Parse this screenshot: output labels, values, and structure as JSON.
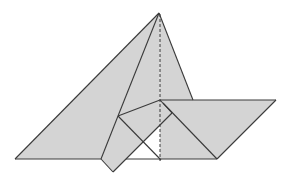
{
  "diagram": {
    "width": 291,
    "height": 186,
    "background": "#ffffff",
    "fill_color": "#d4d4d4",
    "stroke_color": "#3a3a3a",
    "points": {
      "apex": [
        159,
        13
      ],
      "left_base": [
        15,
        159
      ],
      "inner_fold_top": [
        118,
        116
      ],
      "inner_base_left": [
        101,
        159
      ],
      "flap_bottom": [
        113,
        172
      ],
      "rect_top_right": [
        160,
        100
      ],
      "rect_right": [
        172,
        113
      ],
      "white_left": [
        126,
        159
      ],
      "white_top": [
        160,
        126
      ],
      "dash_base": [
        160,
        161
      ],
      "tri_right_at_para": [
        193,
        100
      ],
      "para_top_right": [
        276,
        100
      ],
      "para_bottom_right": [
        217,
        159
      ],
      "thin_diag_end": [
        161,
        160
      ]
    },
    "regions": [
      {
        "name": "big-triangle-left",
        "points": [
          [
            159,
            13
          ],
          [
            15,
            159
          ],
          [
            126,
            159
          ],
          [
            160,
            126
          ]
        ]
      },
      {
        "name": "big-triangle-right",
        "points": [
          [
            159,
            13
          ],
          [
            193,
            100
          ],
          [
            160,
            100
          ]
        ]
      },
      {
        "name": "parallelogram",
        "points": [
          [
            160,
            100
          ],
          [
            276,
            100
          ],
          [
            217,
            159
          ],
          [
            160,
            159
          ]
        ]
      },
      {
        "name": "folded-rectangle",
        "points": [
          [
            118,
            116
          ],
          [
            160,
            100
          ],
          [
            172,
            113
          ],
          [
            113,
            172
          ],
          [
            101,
            159
          ]
        ]
      }
    ],
    "white_region": {
      "name": "white-gap-triangle",
      "points": [
        [
          126,
          159
        ],
        [
          160,
          126
        ],
        [
          160,
          159
        ]
      ]
    },
    "solid_lines": [
      {
        "name": "left-edge",
        "from": [
          159,
          13
        ],
        "to": [
          15,
          159
        ]
      },
      {
        "name": "base-left",
        "from": [
          15,
          159
        ],
        "to": [
          101,
          159
        ]
      },
      {
        "name": "inner-fold-line",
        "from": [
          159,
          13
        ],
        "to": [
          118,
          116
        ]
      },
      {
        "name": "inner-fold-lower",
        "from": [
          118,
          116
        ],
        "to": [
          101,
          159
        ]
      },
      {
        "name": "flap-left",
        "from": [
          101,
          159
        ],
        "to": [
          113,
          172
        ]
      },
      {
        "name": "flap-bottom-edge",
        "from": [
          113,
          172
        ],
        "to": [
          172,
          113
        ]
      },
      {
        "name": "rect-top-edge",
        "from": [
          118,
          116
        ],
        "to": [
          160,
          100
        ]
      },
      {
        "name": "rect-right-edge",
        "from": [
          160,
          100
        ],
        "to": [
          172,
          113
        ]
      },
      {
        "name": "thin-diagonal",
        "from": [
          118,
          116
        ],
        "to": [
          161,
          160
        ]
      },
      {
        "name": "base-middle",
        "from": [
          126,
          159
        ],
        "to": [
          160,
          159
        ]
      },
      {
        "name": "triangle-right-edge",
        "from": [
          159,
          13
        ],
        "to": [
          193,
          100
        ]
      },
      {
        "name": "para-top",
        "from": [
          160,
          100
        ],
        "to": [
          276,
          100
        ]
      },
      {
        "name": "para-right",
        "from": [
          276,
          100
        ],
        "to": [
          217,
          159
        ]
      },
      {
        "name": "para-base",
        "from": [
          160,
          159
        ],
        "to": [
          217,
          159
        ]
      },
      {
        "name": "para-diagonal",
        "from": [
          163,
          103
        ],
        "to": [
          217,
          159
        ]
      }
    ],
    "dashed_lines": [
      {
        "name": "center-fold-dashed",
        "from": [
          160,
          14
        ],
        "to": [
          160,
          161
        ]
      }
    ]
  }
}
